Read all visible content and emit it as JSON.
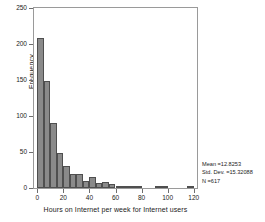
{
  "chart_data": {
    "type": "bar",
    "title": "",
    "subtitle": "",
    "xlabel": "Hours on Internet per week for Internet users",
    "ylabel": "Frequency",
    "xlim": [
      -2.5,
      122.5
    ],
    "ylim": [
      0,
      250
    ],
    "grid": false,
    "legend": null,
    "bin_width": 5,
    "x_ticks": [
      0,
      20,
      40,
      60,
      80,
      100,
      120
    ],
    "y_ticks": [
      0,
      50,
      100,
      150,
      200,
      250
    ],
    "bin_starts": [
      0,
      5,
      10,
      15,
      20,
      25,
      30,
      35,
      40,
      45,
      50,
      55,
      60,
      65,
      70,
      75,
      80,
      85,
      90,
      95,
      100,
      105,
      110,
      115
    ],
    "values": [
      208,
      149,
      90,
      48,
      30,
      20,
      20,
      10,
      15,
      7,
      8,
      6,
      1,
      1,
      3,
      1,
      0,
      0,
      2,
      1,
      0,
      0,
      0,
      2
    ],
    "bar_color": "#8a8a8a",
    "bar_edge_color": "#4f4f4f",
    "annotations": {
      "mean_label": "Mean =12.8253",
      "std_dev_label": "Std. Dev. =15.32088",
      "n_label": "N =617"
    }
  },
  "axes": {
    "y_title": "Frequency",
    "x_title": "Hours on Internet per week for Internet users",
    "y_tick_labels": [
      "0",
      "50",
      "100",
      "150",
      "200",
      "250"
    ],
    "x_tick_labels": [
      "0",
      "20",
      "40",
      "60",
      "80",
      "100",
      "120"
    ]
  },
  "stats": {
    "mean": "Mean =12.8253",
    "std_dev": "Std. Dev. =15.32088",
    "n": "N =617"
  }
}
